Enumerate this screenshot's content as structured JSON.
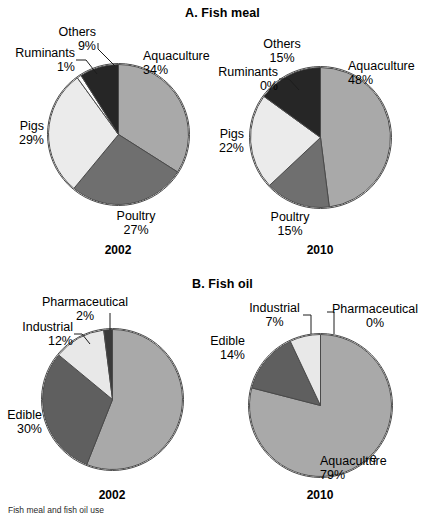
{
  "figure": {
    "caption": "Fish meal and fish oil use"
  },
  "panels": [
    {
      "id": "a",
      "title": "A. Fish meal",
      "charts": [
        {
          "year": "2002",
          "labels": [
            {
              "name": "Aquaculture",
              "pct": "34%"
            },
            {
              "name": "Poultry",
              "pct": "27%"
            },
            {
              "name": "Pigs",
              "pct": "29%"
            },
            {
              "name": "Ruminants",
              "pct": "1%"
            },
            {
              "name": "Others",
              "pct": "9%"
            }
          ]
        },
        {
          "year": "2010",
          "labels": [
            {
              "name": "Aquaculture",
              "pct": "48%"
            },
            {
              "name": "Poultry",
              "pct": "15%"
            },
            {
              "name": "Pigs",
              "pct": "22%"
            },
            {
              "name": "Ruminants",
              "pct": "0%"
            },
            {
              "name": "Others",
              "pct": "15%"
            }
          ]
        }
      ]
    },
    {
      "id": "b",
      "title": "B. Fish oil",
      "charts": [
        {
          "year": "2002",
          "labels": [
            {
              "name": "Aquaculture",
              "pct": "56%"
            },
            {
              "name": "Edible",
              "pct": "30%"
            },
            {
              "name": "Industrial",
              "pct": "12%"
            },
            {
              "name": "Pharmaceutical",
              "pct": "2%"
            }
          ]
        },
        {
          "year": "2010",
          "labels": [
            {
              "name": "Aquaculture",
              "pct": "79%"
            },
            {
              "name": "Edible",
              "pct": "14%"
            },
            {
              "name": "Industrial",
              "pct": "7%"
            },
            {
              "name": "Pharmaceutical",
              "pct": "0%"
            }
          ]
        }
      ]
    }
  ],
  "colors": {
    "aquaculture": "#a9a9a9",
    "poultry": "#6f6f6f",
    "edible": "#5f5f5f",
    "pigs": "#ebebeb",
    "industrial": "#e8e8e8",
    "ruminants": "#fbfbfb",
    "others": "#262626",
    "pharmaceutical": "#3a3a3a",
    "outline": "#4a4a4a",
    "text": "#000000"
  },
  "chart_data": [
    {
      "type": "pie",
      "title": "A. Fish meal",
      "subtitle": "2002",
      "categories": [
        "Aquaculture",
        "Poultry",
        "Pigs",
        "Ruminants",
        "Others"
      ],
      "values": [
        34,
        27,
        29,
        1,
        9
      ],
      "unit": "%",
      "start_angle_deg": 0,
      "direction": "clockwise",
      "legend": "labels-outside",
      "grid": false
    },
    {
      "type": "pie",
      "title": "A. Fish meal",
      "subtitle": "2010",
      "categories": [
        "Aquaculture",
        "Poultry",
        "Pigs",
        "Ruminants",
        "Others"
      ],
      "values": [
        48,
        15,
        22,
        0,
        15
      ],
      "unit": "%",
      "start_angle_deg": 0,
      "direction": "clockwise",
      "legend": "labels-outside",
      "grid": false
    },
    {
      "type": "pie",
      "title": "B. Fish oil",
      "subtitle": "2002",
      "categories": [
        "Aquaculture",
        "Edible",
        "Industrial",
        "Pharmaceutical"
      ],
      "values": [
        56,
        30,
        12,
        2
      ],
      "unit": "%",
      "start_angle_deg": 0,
      "direction": "clockwise",
      "legend": "labels-outside",
      "grid": false
    },
    {
      "type": "pie",
      "title": "B. Fish oil",
      "subtitle": "2010",
      "categories": [
        "Aquaculture",
        "Edible",
        "Industrial",
        "Pharmaceutical"
      ],
      "values": [
        79,
        14,
        7,
        0
      ],
      "unit": "%",
      "start_angle_deg": 0,
      "direction": "clockwise",
      "legend": "labels-outside",
      "grid": false
    }
  ]
}
